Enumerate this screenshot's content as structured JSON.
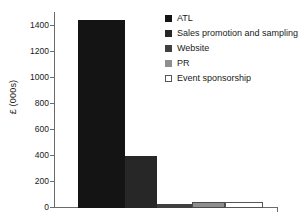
{
  "chart_data": {
    "type": "bar",
    "title": "",
    "subtitle": "",
    "xlabel": "",
    "ylabel": "£ (000s)",
    "categories": [
      "ATL",
      "Sales promotion and sampling",
      "Website",
      "PR",
      "Event sponsorship"
    ],
    "values": [
      1450,
      400,
      30,
      50,
      50
    ],
    "ylim": [
      0,
      1500
    ],
    "y_ticks": [
      0,
      200,
      400,
      600,
      800,
      1000,
      1200,
      1400
    ],
    "y_tick_labels": [
      "0",
      "200",
      "400",
      "600",
      "800",
      "1000",
      "1200",
      "1400"
    ],
    "grid": false,
    "legend_position": "top-right",
    "legend": [
      {
        "label": "ATL",
        "color": "#141414",
        "border": "#141414"
      },
      {
        "label": "Sales promotion and sampling",
        "color": "#272727",
        "border": "#272727"
      },
      {
        "label": "Website",
        "color": "#3f3f3f",
        "border": "#3f3f3f"
      },
      {
        "label": "PR",
        "color": "#8e8e8e",
        "border": "#4a4a4a"
      },
      {
        "label": "Event sponsorship",
        "color": "#ffffff",
        "border": "#555555"
      }
    ],
    "bar_geometry": [
      {
        "name": "ATL",
        "x_pct": 10.2,
        "w_pct": 21.0,
        "value": 1450
      },
      {
        "name": "Sales promotion and sampling",
        "x_pct": 31.2,
        "w_pct": 14.3,
        "value": 400
      },
      {
        "name": "Website",
        "x_pct": 45.5,
        "w_pct": 15.6,
        "value": 30
      },
      {
        "name": "PR",
        "x_pct": 61.1,
        "w_pct": 14.7,
        "value": 50
      },
      {
        "name": "Event sponsorship",
        "x_pct": 75.8,
        "w_pct": 17.0,
        "value": 50
      }
    ],
    "axis_color": "#6b6b6b",
    "text_color": "#1a1a1a",
    "background": "#ffffff"
  }
}
